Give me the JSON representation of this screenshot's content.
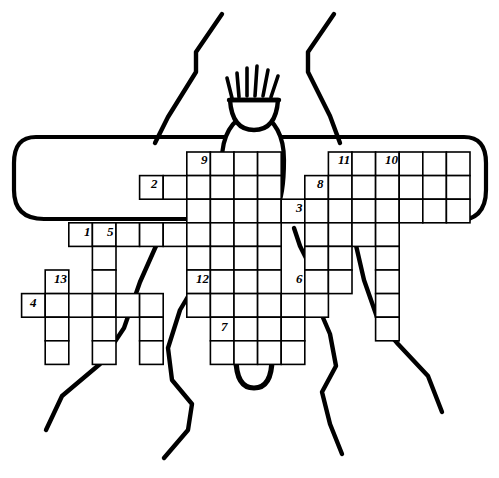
{
  "artwork": {
    "title": "Insect crossword puzzle",
    "subject": "insect-line-drawing",
    "description": "Hand-drawn outline of a winged insect with a bristled head, two antennae, six legs, wings and abdomen, overlaid with an empty crossword grid.",
    "ink_color": "#000000",
    "paper_color": "#ffffff",
    "cell_fill": "#ffffff",
    "cell_stroke": "#000000"
  },
  "grid": {
    "cell_size": 23.6,
    "origin_x": 21.6,
    "origin_y": 152.0,
    "stroke_width": 1.6,
    "note": "Columns and rows are indexed from the origin of the crossword lattice.",
    "cells": [
      {
        "c": 7,
        "r": 0
      },
      {
        "c": 8,
        "r": 0
      },
      {
        "c": 9,
        "r": 0
      },
      {
        "c": 10,
        "r": 0
      },
      {
        "c": 13,
        "r": 0
      },
      {
        "c": 14,
        "r": 0
      },
      {
        "c": 15,
        "r": 0
      },
      {
        "c": 16,
        "r": 0
      },
      {
        "c": 17,
        "r": 0
      },
      {
        "c": 18,
        "r": 0
      },
      {
        "c": 5,
        "r": 1
      },
      {
        "c": 6,
        "r": 1
      },
      {
        "c": 7,
        "r": 1
      },
      {
        "c": 8,
        "r": 1
      },
      {
        "c": 9,
        "r": 1
      },
      {
        "c": 10,
        "r": 1
      },
      {
        "c": 12,
        "r": 1
      },
      {
        "c": 13,
        "r": 1
      },
      {
        "c": 14,
        "r": 1
      },
      {
        "c": 15,
        "r": 1
      },
      {
        "c": 16,
        "r": 1
      },
      {
        "c": 17,
        "r": 1
      },
      {
        "c": 18,
        "r": 1
      },
      {
        "c": 7,
        "r": 2
      },
      {
        "c": 8,
        "r": 2
      },
      {
        "c": 9,
        "r": 2
      },
      {
        "c": 10,
        "r": 2
      },
      {
        "c": 11,
        "r": 2
      },
      {
        "c": 12,
        "r": 2
      },
      {
        "c": 13,
        "r": 2
      },
      {
        "c": 14,
        "r": 2
      },
      {
        "c": 15,
        "r": 2
      },
      {
        "c": 16,
        "r": 2
      },
      {
        "c": 17,
        "r": 2
      },
      {
        "c": 18,
        "r": 2
      },
      {
        "c": 2,
        "r": 3
      },
      {
        "c": 3,
        "r": 3
      },
      {
        "c": 4,
        "r": 3
      },
      {
        "c": 5,
        "r": 3
      },
      {
        "c": 6,
        "r": 3
      },
      {
        "c": 7,
        "r": 3
      },
      {
        "c": 8,
        "r": 3
      },
      {
        "c": 9,
        "r": 3
      },
      {
        "c": 10,
        "r": 3
      },
      {
        "c": 12,
        "r": 3
      },
      {
        "c": 13,
        "r": 3
      },
      {
        "c": 14,
        "r": 3
      },
      {
        "c": 15,
        "r": 3
      },
      {
        "c": 3,
        "r": 4
      },
      {
        "c": 7,
        "r": 4
      },
      {
        "c": 8,
        "r": 4
      },
      {
        "c": 9,
        "r": 4
      },
      {
        "c": 10,
        "r": 4
      },
      {
        "c": 12,
        "r": 4
      },
      {
        "c": 13,
        "r": 4
      },
      {
        "c": 15,
        "r": 4
      },
      {
        "c": 1,
        "r": 5
      },
      {
        "c": 3,
        "r": 5
      },
      {
        "c": 7,
        "r": 5
      },
      {
        "c": 8,
        "r": 5
      },
      {
        "c": 9,
        "r": 5
      },
      {
        "c": 10,
        "r": 5
      },
      {
        "c": 12,
        "r": 5
      },
      {
        "c": 13,
        "r": 5
      },
      {
        "c": 15,
        "r": 5
      },
      {
        "c": 0,
        "r": 6
      },
      {
        "c": 1,
        "r": 6
      },
      {
        "c": 2,
        "r": 6
      },
      {
        "c": 3,
        "r": 6
      },
      {
        "c": 4,
        "r": 6
      },
      {
        "c": 5,
        "r": 6
      },
      {
        "c": 7,
        "r": 6
      },
      {
        "c": 8,
        "r": 6
      },
      {
        "c": 9,
        "r": 6
      },
      {
        "c": 10,
        "r": 6
      },
      {
        "c": 11,
        "r": 6
      },
      {
        "c": 12,
        "r": 6
      },
      {
        "c": 15,
        "r": 6
      },
      {
        "c": 1,
        "r": 7
      },
      {
        "c": 3,
        "r": 7
      },
      {
        "c": 5,
        "r": 7
      },
      {
        "c": 8,
        "r": 7
      },
      {
        "c": 9,
        "r": 7
      },
      {
        "c": 10,
        "r": 7
      },
      {
        "c": 11,
        "r": 7
      },
      {
        "c": 15,
        "r": 7
      },
      {
        "c": 1,
        "r": 8
      },
      {
        "c": 3,
        "r": 8
      },
      {
        "c": 5,
        "r": 8
      },
      {
        "c": 8,
        "r": 8
      },
      {
        "c": 9,
        "r": 8
      },
      {
        "c": 10,
        "r": 8
      },
      {
        "c": 11,
        "r": 8
      }
    ]
  },
  "clues": [
    {
      "label": "9",
      "x": 201,
      "y": 153
    },
    {
      "label": "2",
      "x": 151,
      "y": 177
    },
    {
      "label": "11",
      "x": 338,
      "y": 153
    },
    {
      "label": "10",
      "x": 385,
      "y": 153
    },
    {
      "label": "8",
      "x": 317,
      "y": 177
    },
    {
      "label": "3",
      "x": 296,
      "y": 201
    },
    {
      "label": "1",
      "x": 84,
      "y": 225
    },
    {
      "label": "5",
      "x": 107,
      "y": 225
    },
    {
      "label": "13",
      "x": 54,
      "y": 272
    },
    {
      "label": "4",
      "x": 30,
      "y": 296
    },
    {
      "label": "12",
      "x": 196,
      "y": 272
    },
    {
      "label": "6",
      "x": 296,
      "y": 272
    },
    {
      "label": "7",
      "x": 221,
      "y": 320
    }
  ],
  "insect_parts": [
    {
      "name": "head",
      "label": "head"
    },
    {
      "name": "bristles",
      "label": "head bristles"
    },
    {
      "name": "antenna-left",
      "label": "left antenna"
    },
    {
      "name": "antenna-right",
      "label": "right antenna"
    },
    {
      "name": "thorax",
      "label": "thorax"
    },
    {
      "name": "abdomen",
      "label": "abdomen"
    },
    {
      "name": "wing-left",
      "label": "left wing"
    },
    {
      "name": "wing-right",
      "label": "right wing"
    },
    {
      "name": "legs",
      "label": "legs"
    }
  ]
}
